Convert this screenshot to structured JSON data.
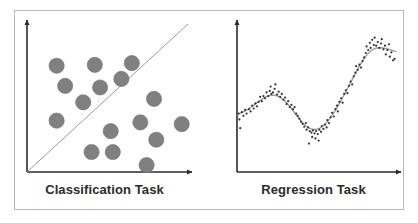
{
  "figure": {
    "width": 418,
    "height": 223,
    "background_color": "#ffffff",
    "frame_color": "#b9b9b9",
    "panel_count": 2
  },
  "panels": [
    {
      "id": "classification",
      "label": "Classification Task",
      "axis_color": "#2b2b2b",
      "marker_color": "#808080",
      "marker_edge_color": "#6e6e6e",
      "divider_color": "#9a9a9a"
    },
    {
      "id": "regression",
      "label": "Regression Task",
      "axis_color": "#2b2b2b",
      "marker_color": "#333333",
      "curve_color": "#9a9a9a"
    }
  ],
  "chart_data": [
    {
      "type": "scatter",
      "title": "",
      "xlabel": "Classification Task",
      "ylabel": "",
      "xlim": [
        0,
        100
      ],
      "ylim": [
        0,
        100
      ],
      "grid": false,
      "legend": "none",
      "annotations": [
        {
          "name": "decision-boundary",
          "type": "line",
          "x": [
            0,
            100
          ],
          "y": [
            0,
            100
          ],
          "style": "thin-solid",
          "color": "#9a9a9a"
        }
      ],
      "series": [
        {
          "name": "class-above-boundary",
          "marker": "circle",
          "color": "#808080",
          "points": [
            {
              "x": 18.4,
              "y": 71.8
            },
            {
              "x": 42.1,
              "y": 72.4
            },
            {
              "x": 65.1,
              "y": 73.6
            },
            {
              "x": 23.7,
              "y": 58.2
            },
            {
              "x": 45.4,
              "y": 57.1
            },
            {
              "x": 58.6,
              "y": 62.9
            },
            {
              "x": 34.9,
              "y": 47.1
            },
            {
              "x": 18.4,
              "y": 34.7
            }
          ]
        },
        {
          "name": "class-below-boundary",
          "marker": "circle",
          "color": "#808080",
          "points": [
            {
              "x": 78.9,
              "y": 49.4
            },
            {
              "x": 70.4,
              "y": 33.5
            },
            {
              "x": 96.1,
              "y": 32.4
            },
            {
              "x": 52.0,
              "y": 27.6
            },
            {
              "x": 80.3,
              "y": 21.8
            },
            {
              "x": 40.1,
              "y": 13.5
            },
            {
              "x": 53.3,
              "y": 13.5
            },
            {
              "x": 74.3,
              "y": 4.7
            }
          ]
        }
      ]
    },
    {
      "type": "scatter",
      "title": "",
      "xlabel": "Regression Task",
      "ylabel": "",
      "xlim": [
        0,
        100
      ],
      "ylim": [
        0,
        100
      ],
      "grid": false,
      "legend": "none",
      "annotations": [
        {
          "name": "regression-fit-curve",
          "type": "curve",
          "style": "smooth-solid",
          "color": "#9a9a9a",
          "description": "wavy fit: local peak near x=22, trough near x=48, steep rise to global peak near x=84, slight decline after"
        }
      ],
      "series": [
        {
          "name": "observations",
          "marker": "point",
          "color": "#333333",
          "points": [
            {
              "x": 1.0,
              "y": 40.0
            },
            {
              "x": 1.5,
              "y": 36.0
            },
            {
              "x": 2.0,
              "y": 30.0
            },
            {
              "x": 3.0,
              "y": 41.0
            },
            {
              "x": 4.0,
              "y": 38.5
            },
            {
              "x": 5.0,
              "y": 42.5
            },
            {
              "x": 6.0,
              "y": 40.0
            },
            {
              "x": 7.5,
              "y": 43.0
            },
            {
              "x": 8.5,
              "y": 41.5
            },
            {
              "x": 9.5,
              "y": 45.5
            },
            {
              "x": 10.5,
              "y": 43.5
            },
            {
              "x": 11.5,
              "y": 47.0
            },
            {
              "x": 12.5,
              "y": 45.0
            },
            {
              "x": 13.5,
              "y": 48.0
            },
            {
              "x": 14.5,
              "y": 51.5
            },
            {
              "x": 15.5,
              "y": 48.5
            },
            {
              "x": 16.5,
              "y": 52.0
            },
            {
              "x": 17.5,
              "y": 50.5
            },
            {
              "x": 18.5,
              "y": 54.5
            },
            {
              "x": 19.5,
              "y": 52.0
            },
            {
              "x": 20.5,
              "y": 55.5
            },
            {
              "x": 21.0,
              "y": 58.5
            },
            {
              "x": 21.5,
              "y": 53.5
            },
            {
              "x": 22.5,
              "y": 54.5
            },
            {
              "x": 23.5,
              "y": 57.0
            },
            {
              "x": 24.0,
              "y": 60.0
            },
            {
              "x": 25.0,
              "y": 53.0
            },
            {
              "x": 26.0,
              "y": 55.0
            },
            {
              "x": 27.0,
              "y": 51.5
            },
            {
              "x": 28.0,
              "y": 53.5
            },
            {
              "x": 29.0,
              "y": 49.5
            },
            {
              "x": 30.0,
              "y": 51.0
            },
            {
              "x": 31.0,
              "y": 46.5
            },
            {
              "x": 32.0,
              "y": 48.5
            },
            {
              "x": 33.0,
              "y": 44.5
            },
            {
              "x": 34.0,
              "y": 46.0
            },
            {
              "x": 35.0,
              "y": 43.0
            },
            {
              "x": 36.0,
              "y": 44.5
            },
            {
              "x": 37.0,
              "y": 40.0
            },
            {
              "x": 38.0,
              "y": 38.5
            },
            {
              "x": 39.0,
              "y": 36.5
            },
            {
              "x": 40.0,
              "y": 34.5
            },
            {
              "x": 41.0,
              "y": 33.0
            },
            {
              "x": 42.0,
              "y": 31.0
            },
            {
              "x": 43.0,
              "y": 33.5
            },
            {
              "x": 43.5,
              "y": 29.0
            },
            {
              "x": 44.5,
              "y": 30.5
            },
            {
              "x": 45.0,
              "y": 19.5
            },
            {
              "x": 45.5,
              "y": 28.0
            },
            {
              "x": 46.5,
              "y": 27.0
            },
            {
              "x": 47.0,
              "y": 24.0
            },
            {
              "x": 47.5,
              "y": 28.5
            },
            {
              "x": 48.5,
              "y": 26.5
            },
            {
              "x": 49.0,
              "y": 23.0
            },
            {
              "x": 49.5,
              "y": 28.0
            },
            {
              "x": 50.5,
              "y": 26.0
            },
            {
              "x": 51.0,
              "y": 21.5
            },
            {
              "x": 51.5,
              "y": 29.0
            },
            {
              "x": 52.5,
              "y": 27.5
            },
            {
              "x": 53.0,
              "y": 31.5
            },
            {
              "x": 54.0,
              "y": 29.5
            },
            {
              "x": 55.0,
              "y": 32.5
            },
            {
              "x": 56.0,
              "y": 30.5
            },
            {
              "x": 56.5,
              "y": 35.5
            },
            {
              "x": 57.5,
              "y": 33.5
            },
            {
              "x": 58.5,
              "y": 37.5
            },
            {
              "x": 59.5,
              "y": 40.5
            },
            {
              "x": 60.5,
              "y": 38.0
            },
            {
              "x": 61.5,
              "y": 43.0
            },
            {
              "x": 62.5,
              "y": 45.5
            },
            {
              "x": 63.0,
              "y": 41.5
            },
            {
              "x": 64.0,
              "y": 48.0
            },
            {
              "x": 65.0,
              "y": 50.5
            },
            {
              "x": 66.0,
              "y": 47.5
            },
            {
              "x": 67.0,
              "y": 53.5
            },
            {
              "x": 68.0,
              "y": 56.0
            },
            {
              "x": 69.0,
              "y": 54.0
            },
            {
              "x": 70.0,
              "y": 59.0
            },
            {
              "x": 71.0,
              "y": 62.0
            },
            {
              "x": 72.0,
              "y": 60.0
            },
            {
              "x": 73.0,
              "y": 65.5
            },
            {
              "x": 74.0,
              "y": 68.0
            },
            {
              "x": 74.5,
              "y": 72.5
            },
            {
              "x": 75.5,
              "y": 70.0
            },
            {
              "x": 76.5,
              "y": 73.5
            },
            {
              "x": 77.5,
              "y": 71.5
            },
            {
              "x": 78.5,
              "y": 76.0
            },
            {
              "x": 79.5,
              "y": 78.5
            },
            {
              "x": 80.5,
              "y": 81.5
            },
            {
              "x": 81.0,
              "y": 86.0
            },
            {
              "x": 82.0,
              "y": 83.5
            },
            {
              "x": 83.0,
              "y": 88.5
            },
            {
              "x": 83.5,
              "y": 85.0
            },
            {
              "x": 84.5,
              "y": 90.5
            },
            {
              "x": 85.5,
              "y": 87.0
            },
            {
              "x": 86.0,
              "y": 92.0
            },
            {
              "x": 87.0,
              "y": 86.5
            },
            {
              "x": 88.0,
              "y": 89.0
            },
            {
              "x": 89.0,
              "y": 85.0
            },
            {
              "x": 90.0,
              "y": 88.0
            },
            {
              "x": 90.5,
              "y": 91.0
            },
            {
              "x": 91.5,
              "y": 84.0
            },
            {
              "x": 92.5,
              "y": 86.5
            },
            {
              "x": 93.0,
              "y": 80.5
            },
            {
              "x": 94.0,
              "y": 83.5
            },
            {
              "x": 95.0,
              "y": 87.5
            },
            {
              "x": 95.5,
              "y": 79.0
            },
            {
              "x": 96.5,
              "y": 82.0
            },
            {
              "x": 97.5,
              "y": 76.5
            },
            {
              "x": 98.5,
              "y": 77.5
            }
          ]
        }
      ]
    }
  ]
}
